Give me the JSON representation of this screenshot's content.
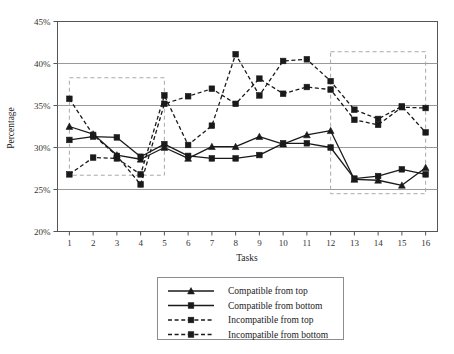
{
  "chart_data": {
    "type": "line",
    "title": "",
    "xlabel": "Tasks",
    "ylabel": "Percentage",
    "categories": [
      "1",
      "2",
      "3",
      "4",
      "5",
      "6",
      "7",
      "8",
      "9",
      "10",
      "11",
      "12",
      "13",
      "14",
      "15",
      "16"
    ],
    "x": [
      1,
      2,
      3,
      4,
      5,
      6,
      7,
      8,
      9,
      10,
      11,
      12,
      13,
      14,
      15,
      16
    ],
    "xlim": [
      0.5,
      16.5
    ],
    "ylim": [
      20,
      45
    ],
    "yticks": [
      20,
      25,
      30,
      35,
      40,
      45
    ],
    "ytick_labels": [
      "20%",
      "25%",
      "30%",
      "35%",
      "40%",
      "45%"
    ],
    "xticks": [
      1,
      2,
      3,
      4,
      5,
      6,
      7,
      8,
      9,
      10,
      11,
      12,
      13,
      14,
      15,
      16
    ],
    "grid": "horizontal",
    "legend_position": "below-center",
    "series": [
      {
        "name": "Compatible from top",
        "marker": "triangle",
        "dash": "solid",
        "color": "#1a1a1a",
        "values": [
          32.5,
          31.6,
          29.1,
          28.6,
          30.0,
          28.7,
          30.1,
          30.1,
          31.3,
          30.4,
          31.5,
          32.0,
          26.2,
          26.1,
          25.5,
          27.6
        ]
      },
      {
        "name": "Compatible from bottom",
        "marker": "square",
        "dash": "solid",
        "color": "#1a1a1a",
        "values": [
          30.9,
          31.3,
          31.2,
          28.9,
          30.4,
          29.0,
          28.7,
          28.7,
          29.1,
          30.5,
          30.5,
          30.0,
          26.3,
          26.6,
          27.4,
          26.8
        ]
      },
      {
        "name": "Incompatible from top",
        "marker": "square",
        "dash": "dashed",
        "color": "#1a1a1a",
        "values": [
          35.8,
          31.5,
          29.0,
          25.6,
          35.2,
          36.1,
          37.0,
          35.2,
          38.2,
          36.4,
          37.2,
          36.9,
          33.3,
          32.7,
          34.8,
          34.7
        ]
      },
      {
        "name": "Incompatible from bottom",
        "marker": "square",
        "dash": "dashed",
        "color": "#1a1a1a",
        "values": [
          26.8,
          28.8,
          28.7,
          26.8,
          36.2,
          30.3,
          32.6,
          41.1,
          36.2,
          40.3,
          40.5,
          37.9,
          34.5,
          33.4,
          34.9,
          31.8
        ]
      }
    ],
    "annotations": [
      {
        "type": "highlight-box",
        "name": "left-highlight-box",
        "x0": 1,
        "x1": 5,
        "y0": 26.7,
        "y1": 38.3
      },
      {
        "type": "highlight-box",
        "name": "right-highlight-box",
        "x0": 12,
        "x1": 16,
        "y0": 24.5,
        "y1": 41.4
      }
    ]
  },
  "legend": {
    "items": [
      {
        "label": "Compatible from top"
      },
      {
        "label": "Compatible from bottom"
      },
      {
        "label": "Incompatible from top"
      },
      {
        "label": "Incompatible from bottom"
      }
    ]
  },
  "colors": {
    "line": "#1a1a1a",
    "grid": "#8d8d8d",
    "frame": "#555555",
    "highlight": "#a8a8a8",
    "text": "#222222"
  }
}
